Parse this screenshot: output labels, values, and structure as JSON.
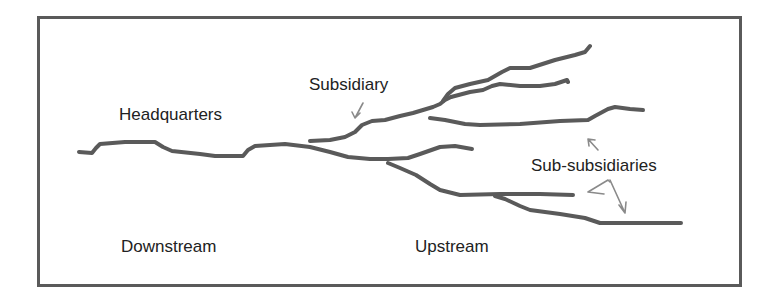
{
  "diagram": {
    "type": "river-network-metaphor",
    "labels": {
      "headquarters": "Headquarters",
      "subsidiary": "Subsidiary",
      "sub_subsidiaries": "Sub-subsidiaries",
      "downstream": "Downstream",
      "upstream": "Upstream"
    },
    "colors": {
      "stroke": "#5a5a5a",
      "arrow": "#8a8a8a",
      "frame": "#5a5a5a",
      "text": "#222222",
      "background": "#ffffff"
    }
  }
}
